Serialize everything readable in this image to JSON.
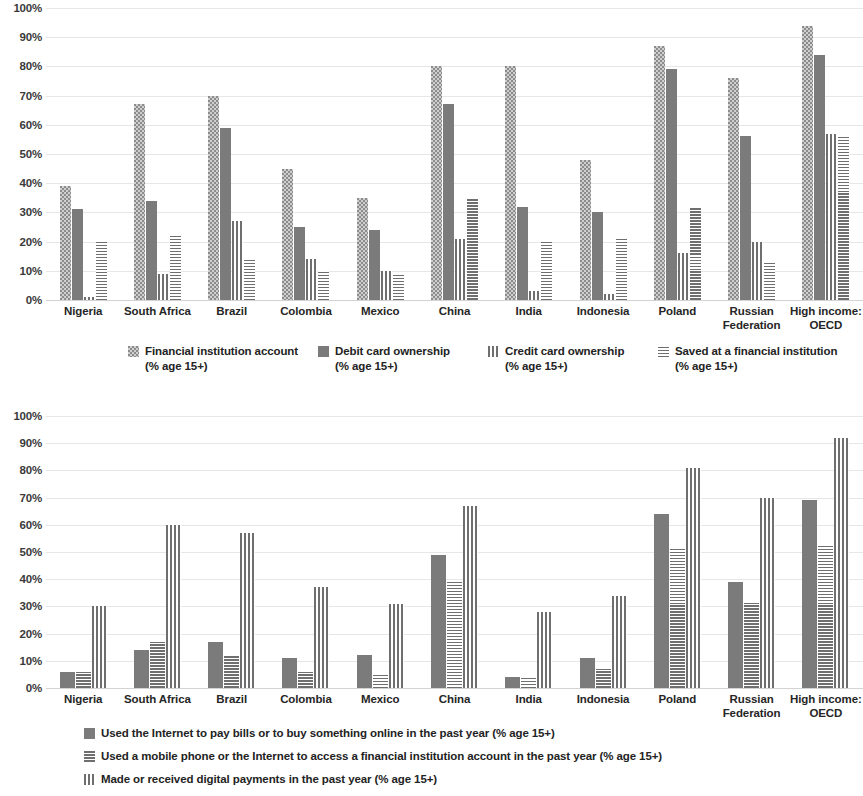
{
  "chart_data": [
    {
      "type": "bar",
      "title": "",
      "xlabel": "",
      "ylabel": "",
      "ylim": [
        0,
        100
      ],
      "ytick_labels": [
        "100%",
        "90%",
        "80%",
        "70%",
        "60%",
        "50%",
        "40%",
        "30%",
        "20%",
        "10%",
        "0%"
      ],
      "ytick_values": [
        100,
        90,
        80,
        70,
        60,
        50,
        40,
        30,
        20,
        10,
        0
      ],
      "grid": true,
      "legend_position": "bottom",
      "categories": [
        "Nigeria",
        "South Africa",
        "Brazil",
        "Colombia",
        "Mexico",
        "China",
        "India",
        "Indonesia",
        "Poland",
        "Russian Federation",
        "High income: OECD"
      ],
      "category_lines": [
        [
          "Nigeria"
        ],
        [
          "South Africa"
        ],
        [
          "Brazil"
        ],
        [
          "Colombia"
        ],
        [
          "Mexico"
        ],
        [
          "China"
        ],
        [
          "India"
        ],
        [
          "Indonesia"
        ],
        [
          "Poland"
        ],
        [
          "Russian",
          "Federation"
        ],
        [
          "High income:",
          "OECD"
        ]
      ],
      "series": [
        {
          "name": "Financial institution account (% age 15+)",
          "pattern": "dots",
          "values": [
            39,
            67,
            70,
            45,
            35,
            80,
            80,
            48,
            87,
            76,
            94
          ]
        },
        {
          "name": "Debit card ownership (% age 15+)",
          "pattern": "solid",
          "values": [
            31,
            34,
            59,
            25,
            24,
            67,
            32,
            30,
            79,
            56,
            84
          ]
        },
        {
          "name": "Credit card ownership (% age 15+)",
          "pattern": "vertical-stripes",
          "values": [
            1,
            9,
            27,
            14,
            10,
            21,
            3,
            2,
            16,
            20,
            57
          ]
        },
        {
          "name": "Saved at a financial institution (% age 15+)",
          "pattern": "horizontal-stripes",
          "values": [
            20,
            22,
            14,
            10,
            9,
            35,
            20,
            21,
            32,
            13,
            56
          ]
        }
      ],
      "legend": [
        {
          "line1": "Financial institution account",
          "line2": "(% age 15+)",
          "pattern": "dots"
        },
        {
          "line1": "Debit card ownership",
          "line2": "(% age 15+)",
          "pattern": "solid"
        },
        {
          "line1": "Credit card ownership",
          "line2": "(% age 15+)",
          "pattern": "vertical-stripes"
        },
        {
          "line1": "Saved at a financial institution",
          "line2": "(% age 15+)",
          "pattern": "horizontal-stripes"
        }
      ]
    },
    {
      "type": "bar",
      "title": "",
      "xlabel": "",
      "ylabel": "",
      "ylim": [
        0,
        100
      ],
      "ytick_labels": [
        "100%",
        "90%",
        "80%",
        "70%",
        "60%",
        "50%",
        "40%",
        "30%",
        "20%",
        "10%",
        "0%"
      ],
      "ytick_values": [
        100,
        90,
        80,
        70,
        60,
        50,
        40,
        30,
        20,
        10,
        0
      ],
      "grid": true,
      "legend_position": "bottom",
      "categories": [
        "Nigeria",
        "South Africa",
        "Brazil",
        "Colombia",
        "Mexico",
        "China",
        "India",
        "Indonesia",
        "Poland",
        "Russian Federation",
        "High income: OECD"
      ],
      "category_lines": [
        [
          "Nigeria"
        ],
        [
          "South Africa"
        ],
        [
          "Brazil"
        ],
        [
          "Colombia"
        ],
        [
          "Mexico"
        ],
        [
          "China"
        ],
        [
          "India"
        ],
        [
          "Indonesia"
        ],
        [
          "Poland"
        ],
        [
          "Russian",
          "Federation"
        ],
        [
          "High income:",
          "OECD"
        ]
      ],
      "series": [
        {
          "name": "Used the Internet to pay bills or to buy something online in the past year (% age 15+)",
          "pattern": "solid",
          "values": [
            6,
            14,
            17,
            11,
            12,
            49,
            4,
            11,
            64,
            39,
            69
          ]
        },
        {
          "name": "Used a mobile phone or the Internet to access a financial institution account in the past year (% age 15+)",
          "pattern": "horizontal-stripes",
          "values": [
            6,
            17,
            12,
            6,
            5,
            39,
            4,
            7,
            52,
            32,
            53
          ]
        },
        {
          "name": "Made or received digital payments in the past year (% age 15+)",
          "pattern": "vertical-stripes",
          "values": [
            30,
            60,
            57,
            37,
            31,
            67,
            28,
            34,
            81,
            70,
            92
          ]
        }
      ],
      "legend": [
        {
          "line1": "Used the Internet to pay bills or to buy something online in the past year (% age 15+)",
          "pattern": "solid"
        },
        {
          "line1": "Used a mobile phone or the Internet to access a financial institution account in the past year (% age 15+)",
          "pattern": "horizontal-stripes"
        },
        {
          "line1": "Made or received digital payments in the past year (% age 15+)",
          "pattern": "vertical-stripes"
        }
      ]
    }
  ]
}
